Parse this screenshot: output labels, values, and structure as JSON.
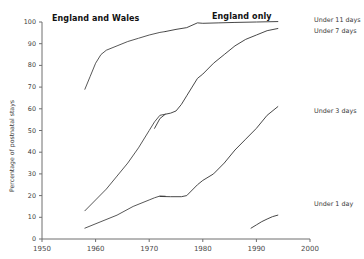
{
  "chart_data": {
    "type": "line",
    "title": "",
    "xlabel": "",
    "ylabel": "Percentage of postnatal stays",
    "xlim": [
      1950,
      2000
    ],
    "ylim": [
      0,
      100
    ],
    "grid": false,
    "legend_position": "right-inline",
    "xticks": [
      1950,
      1960,
      1970,
      1980,
      1990,
      2000
    ],
    "yticks": [
      0,
      10,
      20,
      30,
      40,
      50,
      60,
      70,
      80,
      90,
      100
    ],
    "annotations": [
      {
        "text": "England and Wales",
        "x": 1958,
        "y": 100
      },
      {
        "text": "England only",
        "x": 1978,
        "y": 100
      }
    ],
    "series": [
      {
        "name": "Under 11 days",
        "region": "England and Wales",
        "points": [
          [
            1958,
            69
          ],
          [
            1959,
            75
          ],
          [
            1960,
            81
          ],
          [
            1961,
            85
          ],
          [
            1962,
            87
          ],
          [
            1964,
            89
          ],
          [
            1966,
            91
          ],
          [
            1968,
            92.5
          ],
          [
            1970,
            94
          ],
          [
            1972,
            95.2
          ],
          [
            1973,
            95.6
          ]
        ]
      },
      {
        "name": "Under 11 days",
        "region": "England only",
        "points": [
          [
            1973,
            95.6
          ],
          [
            1975,
            96.6
          ],
          [
            1977,
            97.4
          ],
          [
            1979,
            99.6
          ],
          [
            1980,
            99.4
          ],
          [
            1983,
            99.6
          ],
          [
            1986,
            99.8
          ],
          [
            1990,
            100
          ],
          [
            1994,
            100.2
          ]
        ]
      },
      {
        "name": "Under 7 days",
        "region": "England and Wales",
        "points": [
          [
            1958,
            13
          ],
          [
            1960,
            18
          ],
          [
            1962,
            23
          ],
          [
            1964,
            29
          ],
          [
            1966,
            35
          ],
          [
            1968,
            42
          ],
          [
            1970,
            50
          ],
          [
            1971,
            54
          ],
          [
            1972,
            57
          ],
          [
            1973,
            57.5
          ]
        ]
      },
      {
        "name": "Under 7 days",
        "region": "England only",
        "points": [
          [
            1971,
            51
          ],
          [
            1972,
            55.5
          ],
          [
            1973,
            57.5
          ],
          [
            1974,
            58
          ],
          [
            1975,
            59
          ],
          [
            1976,
            62
          ],
          [
            1977,
            66
          ],
          [
            1978,
            70
          ],
          [
            1979,
            74
          ],
          [
            1980,
            76
          ],
          [
            1982,
            81
          ],
          [
            1984,
            85
          ],
          [
            1986,
            89
          ],
          [
            1988,
            92
          ],
          [
            1990,
            94
          ],
          [
            1992,
            96
          ],
          [
            1994,
            97
          ]
        ]
      },
      {
        "name": "Under 3 days",
        "region": "England and Wales",
        "points": [
          [
            1958,
            5
          ],
          [
            1961,
            8
          ],
          [
            1964,
            11
          ],
          [
            1967,
            15
          ],
          [
            1970,
            18
          ],
          [
            1971,
            19
          ],
          [
            1972,
            19.8
          ],
          [
            1973,
            19.7
          ]
        ]
      },
      {
        "name": "Under 3 days",
        "region": "England only",
        "points": [
          [
            1972,
            19.6
          ],
          [
            1974,
            19.5
          ],
          [
            1976,
            19.5
          ],
          [
            1977,
            20
          ],
          [
            1979,
            25
          ],
          [
            1980,
            27
          ],
          [
            1982,
            30
          ],
          [
            1984,
            35
          ],
          [
            1986,
            41
          ],
          [
            1988,
            46
          ],
          [
            1990,
            51
          ],
          [
            1992,
            57
          ],
          [
            1994,
            61
          ]
        ]
      },
      {
        "name": "Under 1 day",
        "region": "England only",
        "points": [
          [
            1989,
            5
          ],
          [
            1990,
            6.5
          ],
          [
            1991,
            8
          ],
          [
            1992,
            9.2
          ],
          [
            1993,
            10.3
          ],
          [
            1994,
            11
          ]
        ]
      }
    ],
    "series_labels": [
      {
        "text": "Under 11 days",
        "value_at_end": 100
      },
      {
        "text": "Under 7 days",
        "value_at_end": 97
      },
      {
        "text": "Under 3 days",
        "value_at_end": 61
      },
      {
        "text": "Under 1 day",
        "value_at_end": 11
      }
    ]
  }
}
